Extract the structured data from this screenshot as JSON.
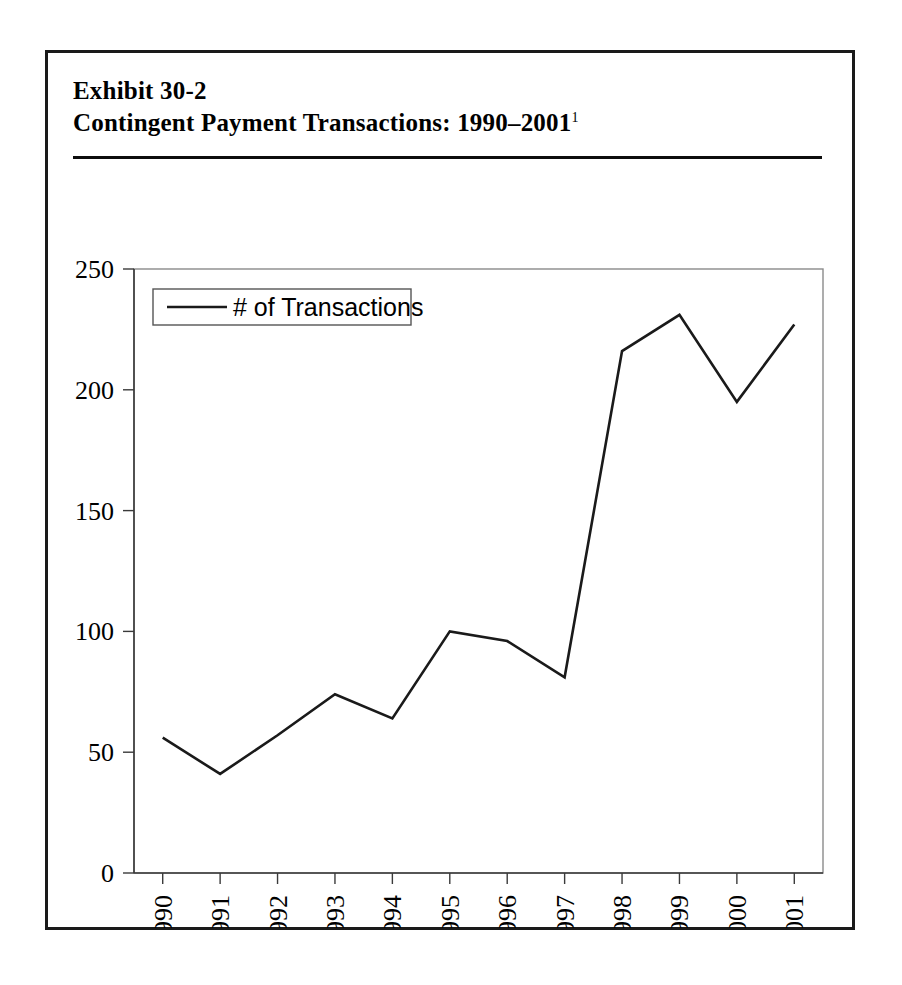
{
  "exhibit": {
    "title_line1": "Exhibit 30-2",
    "title_line2_main": "Contingent Payment Transactions: 1990–2001",
    "title_footnote_marker": "1"
  },
  "chart_data": {
    "type": "line",
    "title": "Contingent Payment Transactions: 1990–2001",
    "xlabel": "",
    "ylabel": "",
    "categories": [
      "1990",
      "1991",
      "1992",
      "1993",
      "1994",
      "1995",
      "1996",
      "1997",
      "1998",
      "1999",
      "2000",
      "2001"
    ],
    "series": [
      {
        "name": "# of Transactions",
        "values": [
          56,
          41,
          57,
          74,
          64,
          100,
          96,
          81,
          216,
          231,
          195,
          227
        ],
        "color": "#1a1a1a"
      }
    ],
    "ylim": [
      0,
      250
    ],
    "yticks": [
      0,
      50,
      100,
      150,
      200,
      250
    ],
    "ytick_labels": [
      "0",
      "50",
      "100",
      "150",
      "200",
      "250"
    ],
    "grid": false,
    "legend_position": "upper-left",
    "legend_entries": [
      "# of Transactions"
    ]
  }
}
